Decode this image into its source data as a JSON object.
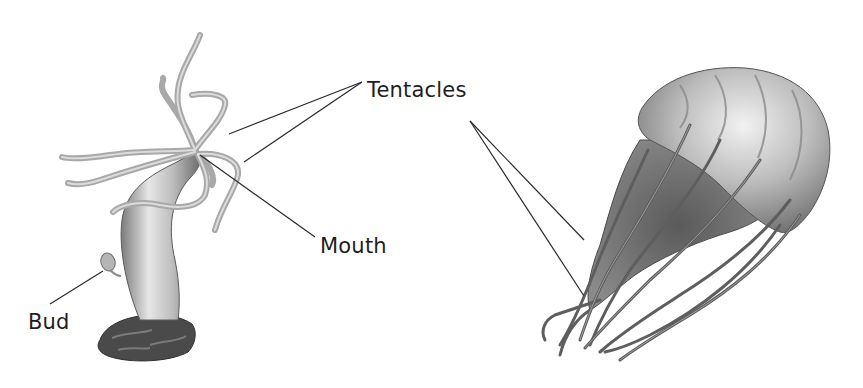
{
  "diagram": {
    "subjects": [
      {
        "id": "hydra",
        "name": "Hydra (polyp form)"
      },
      {
        "id": "jellyfish",
        "name": "Jellyfish (medusa form)"
      }
    ],
    "labels": {
      "tentacles": {
        "text": "Tentacles",
        "x": 367,
        "y": 89
      },
      "mouth": {
        "text": "Mouth",
        "x": 320,
        "y": 235
      },
      "bud": {
        "text": "Bud",
        "x": 28,
        "y": 312
      }
    },
    "leader_lines": [
      {
        "label": "tentacles",
        "from": [
          362,
          82
        ],
        "to": [
          229,
          134
        ]
      },
      {
        "label": "tentacles",
        "from": [
          362,
          82
        ],
        "to": [
          244,
          162
        ]
      },
      {
        "label": "tentacles",
        "from": [
          470,
          121
        ],
        "to": [
          584,
          240
        ]
      },
      {
        "label": "tentacles",
        "from": [
          470,
          121
        ],
        "to": [
          584,
          296
        ]
      },
      {
        "label": "mouth",
        "from": [
          200,
          155
        ],
        "to": [
          315,
          237
        ]
      },
      {
        "label": "bud",
        "from": [
          103,
          271
        ],
        "to": [
          50,
          304
        ]
      }
    ],
    "colors": {
      "text": "#1e1e1e",
      "line": "#2a2a2a",
      "background": "#ffffff"
    }
  }
}
